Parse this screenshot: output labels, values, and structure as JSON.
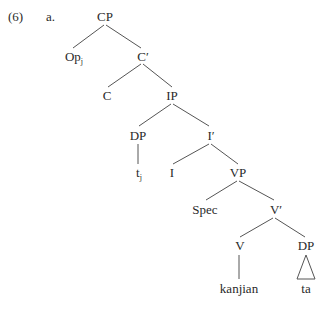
{
  "example": {
    "number": "(6)",
    "letter": "a."
  },
  "tree": {
    "nodes": {
      "cp": "CP",
      "op": "Op",
      "op_sub": "j",
      "c_bar": "C′",
      "c": "C",
      "ip": "IP",
      "dp_subject": "DP",
      "trace": "t",
      "trace_sub": "j",
      "i_bar": "I′",
      "i": "I",
      "vp": "VP",
      "spec": "Spec",
      "v_bar": "V′",
      "v": "V",
      "dp_object": "DP",
      "verb_word": "kanjian",
      "object_word": "ta"
    },
    "colors": {
      "text": "#2a2a2a",
      "lines": "#555555",
      "background": "#ffffff"
    }
  }
}
